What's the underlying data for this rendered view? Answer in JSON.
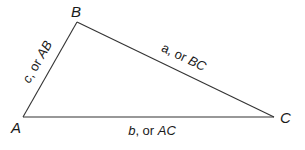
{
  "diagram": {
    "type": "triangle",
    "stroke_color": "#333333",
    "text_color": "#1a1a1a",
    "vertices": [
      {
        "name": "A",
        "label": "A",
        "x": 23,
        "y": 117
      },
      {
        "name": "B",
        "label": "B",
        "x": 77,
        "y": 22
      },
      {
        "name": "C",
        "label": "C",
        "x": 274,
        "y": 117
      }
    ],
    "sides": [
      {
        "name": "c",
        "from": "A",
        "to": "B",
        "letter": "c",
        "sep": ", or ",
        "segment": "AB"
      },
      {
        "name": "a",
        "from": "B",
        "to": "C",
        "letter": "a",
        "sep": ", or ",
        "segment": "BC"
      },
      {
        "name": "b",
        "from": "A",
        "to": "C",
        "letter": "b",
        "sep": ", or ",
        "segment": "AC"
      }
    ]
  }
}
